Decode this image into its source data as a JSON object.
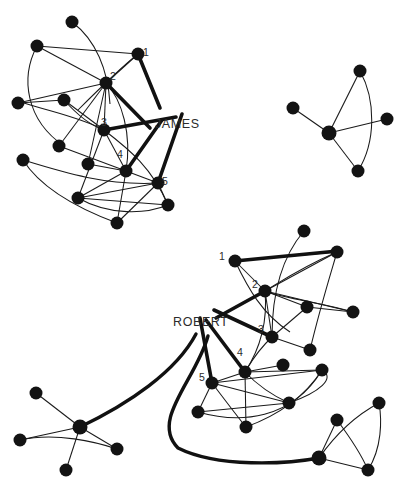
{
  "diagram": {
    "background_color": "#ffffff",
    "node_color": "#131313",
    "edge_color": "#1a1a1a",
    "highlight_edge_color": "#111111",
    "name_labels": [
      {
        "id": "james",
        "text": "JAMES",
        "x": 155,
        "y": 128
      },
      {
        "id": "robert",
        "text": "ROBERT",
        "x": 173,
        "y": 326
      }
    ],
    "rank_labels": [
      {
        "cluster": "james",
        "text": "1",
        "x": 146,
        "y": 56
      },
      {
        "cluster": "james",
        "text": "2",
        "x": 113,
        "y": 80
      },
      {
        "cluster": "james",
        "text": "3",
        "x": 104,
        "y": 126
      },
      {
        "cluster": "james",
        "text": "4",
        "x": 120,
        "y": 158
      },
      {
        "cluster": "james",
        "text": "5",
        "x": 165,
        "y": 185
      },
      {
        "cluster": "robert",
        "text": "1",
        "x": 222,
        "y": 260
      },
      {
        "cluster": "robert",
        "text": "2",
        "x": 255,
        "y": 288
      },
      {
        "cluster": "robert",
        "text": "3",
        "x": 261,
        "y": 333
      },
      {
        "cluster": "robert",
        "text": "4",
        "x": 240,
        "y": 356
      },
      {
        "cluster": "robert",
        "text": "5",
        "x": 202,
        "y": 381
      }
    ],
    "nodes": [
      {
        "id": "j-a",
        "x": 72,
        "y": 22,
        "r": 6.5
      },
      {
        "id": "j-b",
        "x": 37,
        "y": 46,
        "r": 6.5
      },
      {
        "id": "j-1",
        "x": 138,
        "y": 54,
        "r": 6.5
      },
      {
        "id": "j-2",
        "x": 106,
        "y": 83,
        "r": 6.5
      },
      {
        "id": "j-c",
        "x": 18,
        "y": 103,
        "r": 6.5
      },
      {
        "id": "j-d",
        "x": 64,
        "y": 100,
        "r": 6.5
      },
      {
        "id": "j-3",
        "x": 104,
        "y": 130,
        "r": 6.5
      },
      {
        "id": "j-e",
        "x": 59,
        "y": 146,
        "r": 6.5
      },
      {
        "id": "j-f",
        "x": 23,
        "y": 160,
        "r": 6.5
      },
      {
        "id": "j-g",
        "x": 88,
        "y": 164,
        "r": 6.5
      },
      {
        "id": "j-4",
        "x": 126,
        "y": 171,
        "r": 6.5
      },
      {
        "id": "j-5",
        "x": 158,
        "y": 183,
        "r": 6.5
      },
      {
        "id": "j-h",
        "x": 78,
        "y": 198,
        "r": 6.5
      },
      {
        "id": "j-i",
        "x": 168,
        "y": 205,
        "r": 6.5
      },
      {
        "id": "j-j",
        "x": 117,
        "y": 223,
        "r": 6.5
      },
      {
        "id": "t-hub",
        "x": 329,
        "y": 133,
        "r": 7.5
      },
      {
        "id": "t-a",
        "x": 360,
        "y": 71,
        "r": 6.5
      },
      {
        "id": "t-b",
        "x": 293,
        "y": 108,
        "r": 6.5
      },
      {
        "id": "t-c",
        "x": 387,
        "y": 119,
        "r": 6.5
      },
      {
        "id": "t-d",
        "x": 358,
        "y": 171,
        "r": 6.5
      },
      {
        "id": "r-1",
        "x": 235,
        "y": 261,
        "r": 6.5
      },
      {
        "id": "r-a",
        "x": 304,
        "y": 231,
        "r": 6.5
      },
      {
        "id": "r-b",
        "x": 337,
        "y": 252,
        "r": 6.5
      },
      {
        "id": "r-2",
        "x": 265,
        "y": 291,
        "r": 6.5
      },
      {
        "id": "r-c",
        "x": 307,
        "y": 307,
        "r": 6.5
      },
      {
        "id": "r-d",
        "x": 353,
        "y": 312,
        "r": 6.5
      },
      {
        "id": "r-3",
        "x": 272,
        "y": 337,
        "r": 6.5
      },
      {
        "id": "r-e",
        "x": 310,
        "y": 350,
        "r": 6.5
      },
      {
        "id": "r-4",
        "x": 245,
        "y": 372,
        "r": 6.5
      },
      {
        "id": "r-f",
        "x": 283,
        "y": 365,
        "r": 6.5
      },
      {
        "id": "r-5",
        "x": 212,
        "y": 383,
        "r": 6.5
      },
      {
        "id": "r-g",
        "x": 322,
        "y": 370,
        "r": 6.5
      },
      {
        "id": "r-h",
        "x": 198,
        "y": 412,
        "r": 6.5
      },
      {
        "id": "r-i",
        "x": 289,
        "y": 403,
        "r": 6.5
      },
      {
        "id": "r-j",
        "x": 246,
        "y": 427,
        "r": 6.5
      },
      {
        "id": "bl-hub",
        "x": 80,
        "y": 427,
        "r": 7.5
      },
      {
        "id": "bl-a",
        "x": 36,
        "y": 393,
        "r": 6.5
      },
      {
        "id": "bl-b",
        "x": 20,
        "y": 440,
        "r": 6.5
      },
      {
        "id": "bl-c",
        "x": 66,
        "y": 470,
        "r": 6.5
      },
      {
        "id": "bl-d",
        "x": 117,
        "y": 449,
        "r": 6.5
      },
      {
        "id": "br-hub",
        "x": 319,
        "y": 458,
        "r": 7.5
      },
      {
        "id": "br-a",
        "x": 337,
        "y": 420,
        "r": 6.5
      },
      {
        "id": "br-b",
        "x": 368,
        "y": 470,
        "r": 6.5
      },
      {
        "id": "br-c",
        "x": 379,
        "y": 403,
        "r": 6.5
      }
    ],
    "edges_thin": [
      "M72,22 C96,40 108,70 110,104",
      "M37,46 L138,54",
      "M37,46 L106,83",
      "M37,46 C20,78 26,120 64,146",
      "M18,103 L106,83",
      "M18,103 L64,100",
      "M64,100 C80,118 92,126 104,130",
      "M138,54 L106,83",
      "M138,54 C118,70 96,92 78,110",
      "M106,83 L104,130",
      "M106,83 L59,146",
      "M106,83 L88,164",
      "M106,83 C122,100 132,134 126,171",
      "M104,130 L64,100",
      "M104,130 C82,118 52,112 24,103",
      "M104,130 L126,171",
      "M104,130 C130,150 152,168 168,205",
      "M104,130 L78,198",
      "M23,160 C62,172 106,186 158,183",
      "M23,160 C42,190 82,210 117,223",
      "M59,146 L126,171",
      "M88,164 L126,171",
      "M126,171 L158,183",
      "M126,171 L117,223",
      "M126,171 L78,198",
      "M158,183 L78,198",
      "M158,183 L117,223",
      "M158,183 L168,205",
      "M78,198 L168,205",
      "M78,198 C110,216 146,214 168,205",
      "M329,133 L360,71",
      "M329,133 L293,108",
      "M329,133 L387,119",
      "M329,133 L358,171",
      "M360,71 C376,100 376,142 358,171",
      "M235,261 L337,252",
      "M235,261 L265,291",
      "M235,261 C248,288 262,314 290,332",
      "M304,231 C286,252 272,286 272,337",
      "M337,252 L265,291",
      "M337,252 C330,276 320,308 310,350",
      "M337,252 C300,268 280,282 265,291",
      "M265,291 L307,307",
      "M265,291 L272,337",
      "M265,291 L353,312",
      "M265,291 C268,324 258,352 245,372",
      "M265,291 C290,300 320,302 353,312",
      "M307,307 L353,312",
      "M272,337 L310,350",
      "M272,337 L307,307",
      "M272,337 C256,352 250,364 245,372",
      "M245,372 L283,365",
      "M245,372 L212,383",
      "M245,372 L322,370",
      "M245,372 L246,427",
      "M245,372 C262,390 278,398 289,403",
      "M212,383 L322,370",
      "M212,383 L289,403",
      "M212,383 L198,412",
      "M212,383 C228,404 240,420 246,427",
      "M198,412 C240,424 292,420 322,370",
      "M198,412 L289,403",
      "M246,427 C276,416 304,398 322,370",
      "M289,403 C320,392 336,378 322,370",
      "M80,427 L36,393",
      "M80,427 L20,440",
      "M80,427 L66,470",
      "M80,427 L117,449",
      "M20,440 C56,432 96,442 117,449",
      "M319,458 L337,420",
      "M319,458 L368,470",
      "M337,420 C352,440 362,456 368,470",
      "M319,458 C340,428 362,412 379,403",
      "M368,470 C382,448 382,420 379,403"
    ],
    "edges_thick": [
      "M138,54 L160,108",
      "M106,83 L150,128",
      "M104,130 L176,117",
      "M126,171 L162,120",
      "M158,183 L182,114",
      "M235,261 L338,251",
      "M265,291 L216,318",
      "M272,337 L214,310",
      "M245,372 L206,320",
      "M212,383 L200,318"
    ],
    "edges_thick_curve": [
      "M196,334 C176,372 128,404 80,427",
      "M208,336 C196,380 150,420 178,448 C218,468 286,464 319,458"
    ]
  }
}
